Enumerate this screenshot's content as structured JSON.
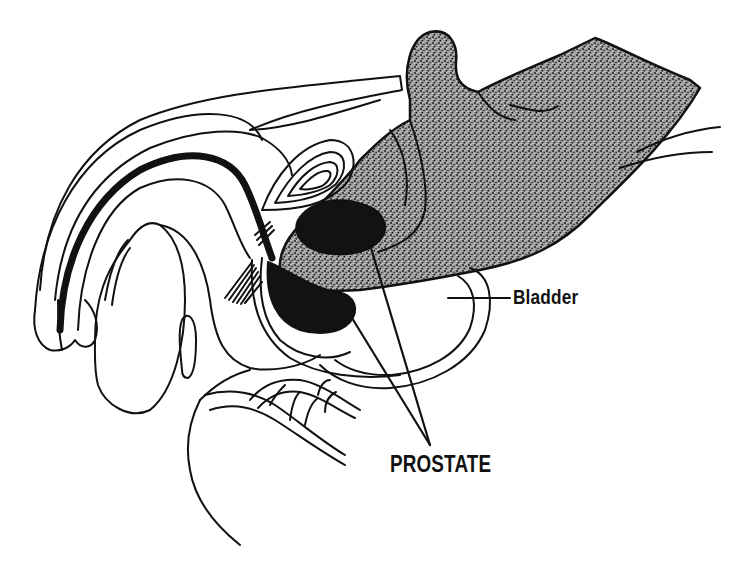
{
  "figure": {
    "colors": {
      "ink": "#111111",
      "background": "#ffffff",
      "stipple_base": "#8a8a8a",
      "solid_fill": "#121212"
    }
  },
  "labels": {
    "bladder": "Bladder",
    "prostate": "PROSTATE"
  }
}
